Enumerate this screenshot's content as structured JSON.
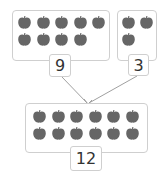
{
  "diagram": {
    "type": "number-bond-addition",
    "colors": {
      "apple": "#666666",
      "border": "#cfcfcf",
      "text": "#333333",
      "line": "#999999"
    },
    "parts": [
      {
        "id": "left",
        "apple_count": 9,
        "label": "9"
      },
      {
        "id": "right",
        "apple_count": 3,
        "label": "3"
      }
    ],
    "whole": {
      "apple_count": 12,
      "label": "12"
    }
  }
}
